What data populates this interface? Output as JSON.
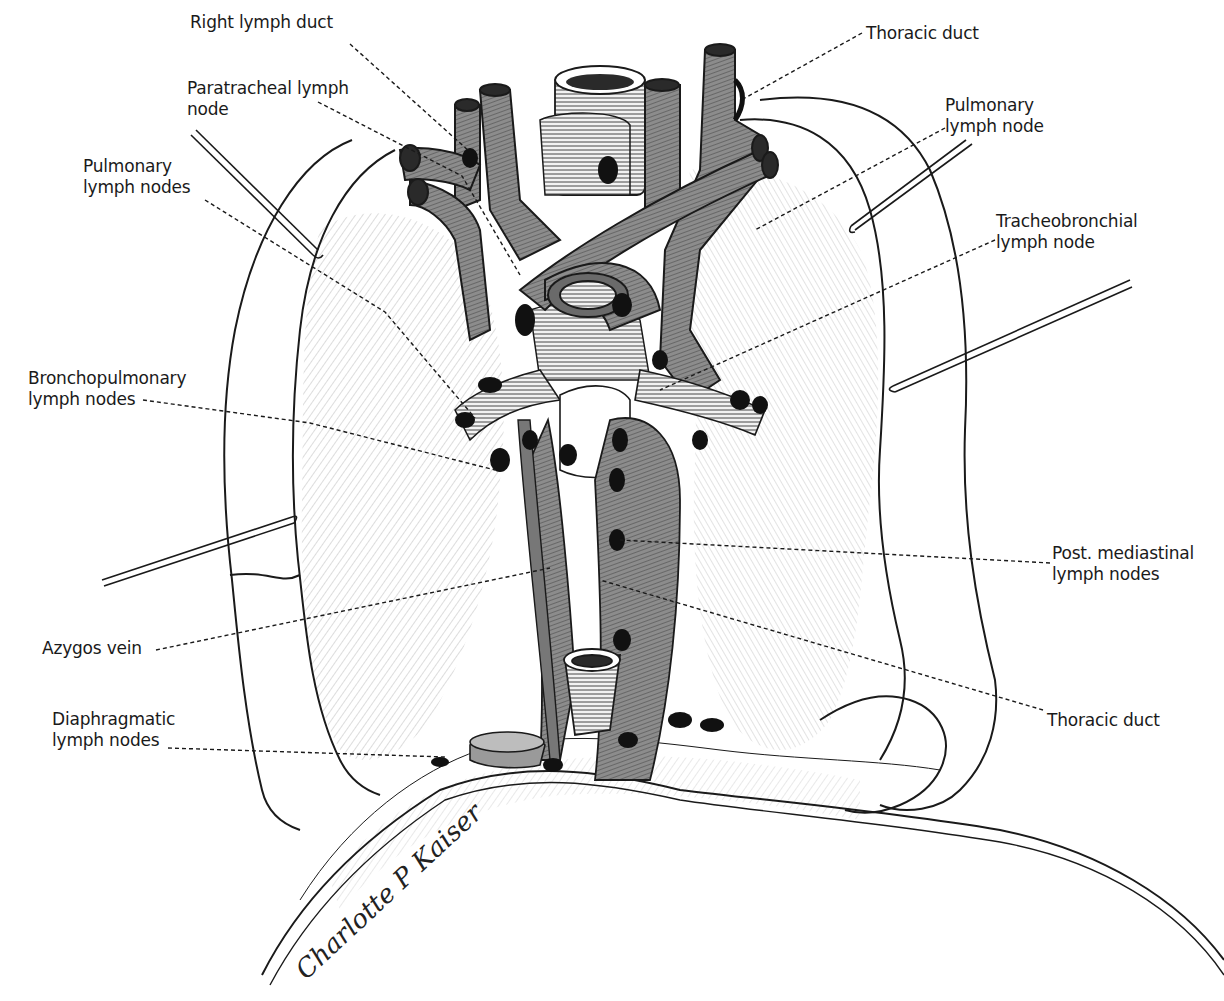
{
  "figure": {
    "colors": {
      "ink": "#1a1a1a",
      "vessel_fill": "#8c8c8c",
      "vessel_dark": "#5a5a5a",
      "node_fill": "#111111",
      "background": "#ffffff"
    }
  },
  "labels": [
    {
      "id": "right-lymph-duct",
      "text": "Right lymph duct",
      "x": 190,
      "y": 12,
      "leader": [
        [
          350,
          44
        ],
        [
          470,
          152
        ]
      ]
    },
    {
      "id": "paratracheal-lymph-node",
      "text": "Paratracheal lymph\nnode",
      "x": 187,
      "y": 78,
      "leader": [
        [
          318,
          102
        ],
        [
          462,
          176
        ],
        [
          520,
          275
        ]
      ]
    },
    {
      "id": "pulmonary-lymph-nodes-left",
      "text": "Pulmonary\nlymph nodes",
      "x": 83,
      "y": 156,
      "leader": [
        [
          205,
          200
        ],
        [
          385,
          312
        ],
        [
          475,
          418
        ]
      ]
    },
    {
      "id": "thoracic-duct-top",
      "text": "Thoracic duct",
      "x": 866,
      "y": 23,
      "leader": [
        [
          862,
          33
        ],
        [
          745,
          98
        ]
      ]
    },
    {
      "id": "pulmonary-lymph-node-right",
      "text": "Pulmonary\nlymph node",
      "x": 945,
      "y": 95,
      "leader": [
        [
          945,
          128
        ],
        [
          755,
          230
        ]
      ]
    },
    {
      "id": "tracheobronchial-lymph-node",
      "text": "Tracheobronchial\nlymph node",
      "x": 996,
      "y": 211,
      "leader": [
        [
          995,
          240
        ],
        [
          660,
          390
        ]
      ]
    },
    {
      "id": "bronchopulmonary-lymph-nodes",
      "text": "Bronchopulmonary\nlymph nodes",
      "x": 28,
      "y": 368,
      "leader": [
        [
          143,
          400
        ],
        [
          310,
          423
        ],
        [
          495,
          470
        ]
      ]
    },
    {
      "id": "post-mediastinal-lymph-nodes",
      "text": "Post. mediastinal\nlymph nodes",
      "x": 1052,
      "y": 543,
      "leader": [
        [
          1050,
          563
        ],
        [
          620,
          540
        ]
      ]
    },
    {
      "id": "azygos-vein",
      "text": "Azygos vein",
      "x": 42,
      "y": 638,
      "leader": [
        [
          156,
          650
        ],
        [
          550,
          568
        ]
      ]
    },
    {
      "id": "thoracic-duct-bottom",
      "text": "Thoracic duct",
      "x": 1047,
      "y": 710,
      "leader": [
        [
          1043,
          710
        ],
        [
          600,
          580
        ]
      ]
    },
    {
      "id": "diaphragmatic-lymph-nodes",
      "text": "Diaphragmatic\nlymph nodes",
      "x": 52,
      "y": 709,
      "leader": [
        [
          168,
          748
        ],
        [
          445,
          757
        ]
      ]
    }
  ],
  "signature": {
    "text": "Charlotte P Kaiser",
    "x": 310,
    "y": 985,
    "rotate": -43
  }
}
